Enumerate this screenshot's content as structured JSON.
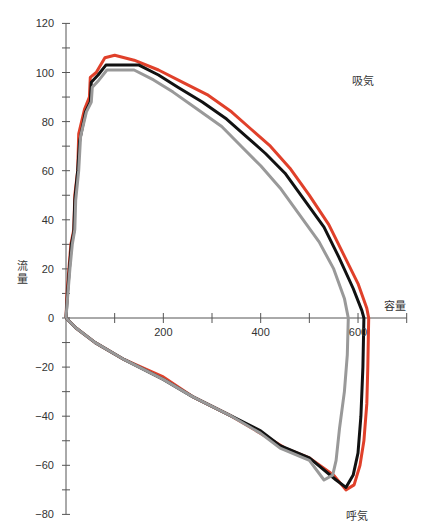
{
  "chart_data": {
    "type": "line",
    "title": "",
    "xlabel": "容量",
    "ylabel": "流量",
    "xlim": [
      0,
      700
    ],
    "ylim": [
      -80,
      120
    ],
    "x_ticks": [
      100,
      200,
      300,
      400,
      500,
      600,
      700
    ],
    "x_tick_labels": [
      {
        "value": 200,
        "label": "200"
      },
      {
        "value": 400,
        "label": "400"
      },
      {
        "value": 600,
        "label": "600"
      }
    ],
    "y_ticks": [
      -80,
      -70,
      -60,
      -50,
      -40,
      -30,
      -20,
      -10,
      0,
      10,
      20,
      30,
      40,
      50,
      60,
      70,
      80,
      90,
      100,
      110,
      120
    ],
    "y_tick_labels": [
      {
        "value": 120,
        "label": "120"
      },
      {
        "value": 100,
        "label": "100"
      },
      {
        "value": 80,
        "label": "80"
      },
      {
        "value": 60,
        "label": "60"
      },
      {
        "value": 40,
        "label": "40"
      },
      {
        "value": 20,
        "label": "20"
      },
      {
        "value": 0,
        "label": "0"
      },
      {
        "value": -20,
        "label": "−20"
      },
      {
        "value": -40,
        "label": "−40"
      },
      {
        "value": -60,
        "label": "−60"
      },
      {
        "value": -80,
        "label": "−80"
      }
    ],
    "annotations": [
      {
        "text": "吸気",
        "x": 600,
        "y": 95
      },
      {
        "text": "呼気",
        "x": 580,
        "y": -80
      }
    ],
    "grid": false,
    "legend": null,
    "series": [
      {
        "name": "red",
        "color": "#e0402a",
        "points": [
          [
            0,
            0
          ],
          [
            2,
            10
          ],
          [
            6,
            20
          ],
          [
            10,
            30
          ],
          [
            16,
            36
          ],
          [
            18,
            50
          ],
          [
            24,
            60
          ],
          [
            26,
            75
          ],
          [
            38,
            85
          ],
          [
            48,
            90
          ],
          [
            50,
            98
          ],
          [
            62,
            100
          ],
          [
            80,
            106
          ],
          [
            100,
            107
          ],
          [
            140,
            105
          ],
          [
            190,
            101
          ],
          [
            240,
            96
          ],
          [
            290,
            91
          ],
          [
            340,
            84
          ],
          [
            380,
            77
          ],
          [
            420,
            70
          ],
          [
            460,
            61
          ],
          [
            500,
            50
          ],
          [
            540,
            38
          ],
          [
            570,
            26
          ],
          [
            600,
            14
          ],
          [
            618,
            4
          ],
          [
            622,
            0
          ],
          [
            620,
            -20
          ],
          [
            618,
            -35
          ],
          [
            612,
            -50
          ],
          [
            604,
            -60
          ],
          [
            592,
            -68
          ],
          [
            575,
            -70
          ],
          [
            550,
            -64
          ],
          [
            500,
            -57
          ],
          [
            450,
            -53
          ],
          [
            400,
            -47
          ],
          [
            340,
            -40
          ],
          [
            260,
            -32
          ],
          [
            200,
            -24
          ],
          [
            120,
            -17
          ],
          [
            60,
            -10
          ],
          [
            20,
            -4
          ],
          [
            0,
            0
          ]
        ]
      },
      {
        "name": "black",
        "color": "#111111",
        "points": [
          [
            0,
            0
          ],
          [
            3,
            10
          ],
          [
            7,
            20
          ],
          [
            11,
            30
          ],
          [
            16,
            35
          ],
          [
            18,
            48
          ],
          [
            24,
            60
          ],
          [
            28,
            72
          ],
          [
            40,
            84
          ],
          [
            50,
            88
          ],
          [
            52,
            96
          ],
          [
            66,
            99
          ],
          [
            82,
            103
          ],
          [
            150,
            103
          ],
          [
            190,
            99
          ],
          [
            230,
            94
          ],
          [
            280,
            88
          ],
          [
            330,
            81
          ],
          [
            370,
            74
          ],
          [
            410,
            67
          ],
          [
            450,
            59
          ],
          [
            490,
            48
          ],
          [
            530,
            37
          ],
          [
            560,
            25
          ],
          [
            590,
            12
          ],
          [
            608,
            3
          ],
          [
            612,
            0
          ],
          [
            610,
            -20
          ],
          [
            606,
            -40
          ],
          [
            600,
            -55
          ],
          [
            590,
            -64
          ],
          [
            575,
            -69
          ],
          [
            555,
            -66
          ],
          [
            500,
            -57
          ],
          [
            440,
            -52
          ],
          [
            400,
            -46
          ],
          [
            340,
            -40
          ],
          [
            260,
            -32
          ],
          [
            200,
            -25
          ],
          [
            120,
            -17
          ],
          [
            60,
            -10
          ],
          [
            20,
            -4
          ],
          [
            0,
            0
          ]
        ]
      },
      {
        "name": "gray",
        "color": "#999999",
        "points": [
          [
            0,
            0
          ],
          [
            4,
            10
          ],
          [
            8,
            20
          ],
          [
            13,
            30
          ],
          [
            18,
            36
          ],
          [
            20,
            48
          ],
          [
            26,
            60
          ],
          [
            30,
            74
          ],
          [
            42,
            84
          ],
          [
            52,
            88
          ],
          [
            54,
            94
          ],
          [
            68,
            97
          ],
          [
            84,
            101
          ],
          [
            140,
            101
          ],
          [
            180,
            97
          ],
          [
            220,
            92
          ],
          [
            270,
            85
          ],
          [
            320,
            78
          ],
          [
            360,
            70
          ],
          [
            400,
            62
          ],
          [
            440,
            53
          ],
          [
            480,
            42
          ],
          [
            520,
            31
          ],
          [
            550,
            20
          ],
          [
            572,
            8
          ],
          [
            580,
            0
          ],
          [
            578,
            -15
          ],
          [
            572,
            -30
          ],
          [
            562,
            -45
          ],
          [
            555,
            -58
          ],
          [
            548,
            -64
          ],
          [
            530,
            -66
          ],
          [
            500,
            -58
          ],
          [
            440,
            -53
          ],
          [
            400,
            -47
          ],
          [
            340,
            -40
          ],
          [
            260,
            -32
          ],
          [
            200,
            -25
          ],
          [
            120,
            -17
          ],
          [
            60,
            -10
          ],
          [
            20,
            -4
          ],
          [
            0,
            0
          ]
        ]
      }
    ]
  }
}
